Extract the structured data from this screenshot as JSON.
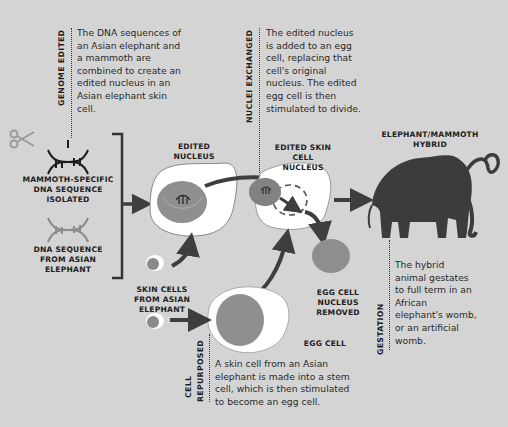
{
  "colors": {
    "background": "#d4d4d4",
    "cell_white": "#ffffff",
    "nucleus_gray": "#8f8f8f",
    "arrow_dark": "#3e3e3e",
    "mammoth": "#3c3c3c",
    "text": "#222222"
  },
  "steps": {
    "genome_edited": {
      "heading": "GENOME EDITED",
      "text": "The DNA sequences of an Asian elephant and a mammoth are combined to create an edited nucleus in an Asian elephant skin cell."
    },
    "nuclei_exchanged": {
      "heading": "NUCLEI EXCHANGED",
      "text": "The edited nucleus is added to an egg cell, replacing that cell's original nucleus. The edited egg cell is then stimulated to divide."
    },
    "cell_repurposed": {
      "heading_line1": "CELL",
      "heading_line2": "REPURPOSED",
      "text": "A skin cell from an Asian elephant is made into a stem cell, which is then stimulated to become an egg cell."
    },
    "gestation": {
      "heading": "GESTATION",
      "text": "The hybrid animal gestates to full term in an African elephant's womb, or an artificial womb."
    }
  },
  "labels": {
    "mammoth_dna": "MAMMOTH-SPECIFIC DNA SEQUENCE ISOLATED",
    "elephant_dna": "DNA SEQUENCE FROM ASIAN ELEPHANT",
    "edited_nucleus": "EDITED NUCLEUS",
    "skin_cells": "SKIN CELLS FROM ASIAN ELEPHANT",
    "edited_skin_cell_nucleus": "EDITED SKIN CELL NUCLEUS",
    "egg_nucleus_removed": "EGG CELL NUCLEUS REMOVED",
    "egg_cell": "EGG CELL",
    "hybrid": "ELEPHANT/MAMMOTH HYBRID"
  },
  "icons": {
    "scissors": "scissors-icon",
    "mammoth_dna": "dna-helix-icon",
    "elephant_dna": "dna-helix-icon",
    "mammoth": "mammoth-silhouette"
  }
}
